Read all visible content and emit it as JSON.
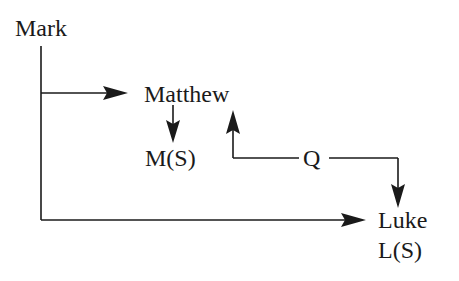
{
  "diagram": {
    "type": "source-dependency flow",
    "nodes": {
      "mark": {
        "label": "Mark"
      },
      "matthew": {
        "label": "Matthew"
      },
      "matthew_special": {
        "label": "M(S)"
      },
      "q": {
        "label": "Q"
      },
      "luke": {
        "label": "Luke"
      },
      "luke_special": {
        "label": "L(S)"
      }
    },
    "edges": [
      {
        "from": "Mark",
        "to": "Matthew"
      },
      {
        "from": "Mark",
        "to": "Luke"
      },
      {
        "from": "Matthew",
        "to": "M(S)"
      },
      {
        "from": "Q",
        "to": "Matthew"
      },
      {
        "from": "Q",
        "to": "Luke"
      }
    ],
    "colors": {
      "ink": "#1a1a1a",
      "background": "#ffffff"
    }
  }
}
